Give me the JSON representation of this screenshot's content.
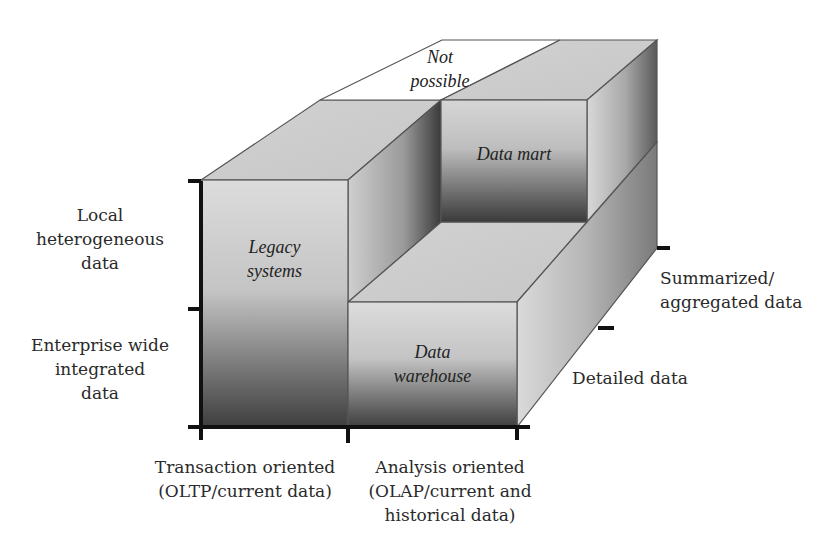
{
  "diagram": {
    "type": "3d-block-matrix",
    "title": "",
    "cells": {
      "legacy_systems": {
        "lines": [
          "Legacy",
          "systems"
        ]
      },
      "data_warehouse": {
        "lines": [
          "Data",
          "warehouse"
        ]
      },
      "data_mart": {
        "lines": [
          "Data mart"
        ]
      },
      "not_possible": {
        "lines": [
          "Not",
          "possible"
        ]
      }
    },
    "vertical_axis": {
      "labels": [
        {
          "lines": [
            "Local",
            "heterogeneous",
            "data"
          ]
        },
        {
          "lines": [
            "Enterprise wide",
            "integrated",
            "data"
          ]
        }
      ]
    },
    "horizontal_axis": {
      "labels": [
        {
          "lines": [
            "Transaction oriented",
            "(OLTP/current data)"
          ]
        },
        {
          "lines": [
            "Analysis oriented",
            "(OLAP/current and",
            "historical data)"
          ]
        }
      ]
    },
    "depth_axis": {
      "labels": [
        {
          "lines": [
            "Summarized/",
            "aggregated data"
          ]
        },
        {
          "lines": [
            "Detailed data"
          ]
        }
      ]
    },
    "colors": {
      "face_light": "#d9d9d9",
      "face_dark": "#3a3a3a",
      "top_face": "#cfcfcf",
      "edge": "#555555",
      "axis": "#111111",
      "background": "#ffffff"
    }
  }
}
